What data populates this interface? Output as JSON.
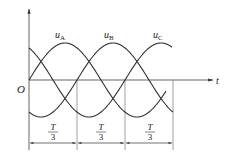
{
  "diagram": {
    "axes": {
      "origin_label": "O",
      "x_label": "t"
    },
    "curves": [
      {
        "name": "u_A",
        "label_main": "u",
        "label_sub": "A",
        "phase_deg": 0
      },
      {
        "name": "u_B",
        "label_main": "u",
        "label_sub": "B",
        "phase_deg": -120
      },
      {
        "name": "u_C",
        "label_main": "u",
        "label_sub": "C",
        "phase_deg": 120
      }
    ],
    "intervals": [
      {
        "num": "T",
        "den": "3"
      },
      {
        "num": "T",
        "den": "3"
      },
      {
        "num": "T",
        "den": "3"
      }
    ],
    "colors": {
      "line": "#333333",
      "axis": "#555555"
    }
  }
}
